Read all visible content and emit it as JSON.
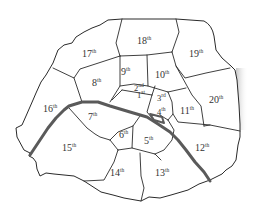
{
  "map": {
    "subject": "Paris arrondissements",
    "river_color": "#5a5a5a",
    "border_color": "#2a2a2a",
    "arrondissements": [
      {
        "num": "1",
        "suffix": "st"
      },
      {
        "num": "2",
        "suffix": "nd"
      },
      {
        "num": "3",
        "suffix": "rd"
      },
      {
        "num": "4",
        "suffix": "th"
      },
      {
        "num": "5",
        "suffix": "th"
      },
      {
        "num": "6",
        "suffix": "th"
      },
      {
        "num": "7",
        "suffix": "th"
      },
      {
        "num": "8",
        "suffix": "th"
      },
      {
        "num": "9",
        "suffix": "th"
      },
      {
        "num": "10",
        "suffix": "th"
      },
      {
        "num": "11",
        "suffix": "th"
      },
      {
        "num": "12",
        "suffix": "th"
      },
      {
        "num": "13",
        "suffix": "th"
      },
      {
        "num": "14",
        "suffix": "th"
      },
      {
        "num": "15",
        "suffix": "th"
      },
      {
        "num": "16",
        "suffix": "th"
      },
      {
        "num": "17",
        "suffix": "th"
      },
      {
        "num": "18",
        "suffix": "th"
      },
      {
        "num": "19",
        "suffix": "th"
      },
      {
        "num": "20",
        "suffix": "th"
      }
    ]
  }
}
